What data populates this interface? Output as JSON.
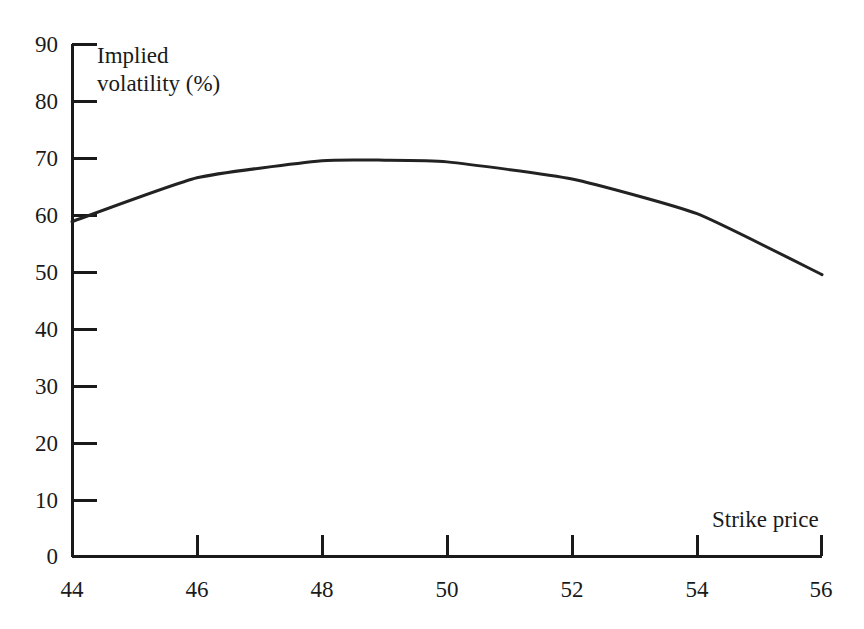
{
  "chart_data": {
    "type": "line",
    "title": "",
    "subtitle": "",
    "xlabel": "Strike price",
    "ylabel": "Implied volatility (%)",
    "xlim": [
      44,
      56
    ],
    "ylim": [
      0,
      90
    ],
    "xticks": [
      44,
      46,
      48,
      50,
      52,
      54,
      56
    ],
    "yticks": [
      0,
      10,
      20,
      30,
      40,
      50,
      60,
      70,
      80,
      90
    ],
    "xtick_labels": [
      "44",
      "46",
      "48",
      "50",
      "52",
      "54",
      "56"
    ],
    "ytick_labels": [
      "0",
      "10",
      "20",
      "30",
      "40",
      "50",
      "60",
      "70",
      "80",
      "90"
    ],
    "grid": false,
    "legend": null,
    "legend_position": "none",
    "annotations": [],
    "series": [
      {
        "name": "Implied volatility",
        "color": "#222222",
        "line_width": 3,
        "x": [
          44,
          46,
          48,
          49,
          50,
          52,
          54,
          56
        ],
        "values": [
          58.8,
          66.5,
          69.5,
          69.6,
          69.3,
          66.3,
          60.2,
          49.5
        ]
      }
    ]
  },
  "axes": {
    "y_title_line1": "Implied",
    "y_title_line2": "volatility (%)",
    "x_title": "Strike price"
  },
  "colors": {
    "background": "#ffffff",
    "axis": "#1a1a1a",
    "curve": "#222222",
    "text": "#1a1a1a"
  }
}
